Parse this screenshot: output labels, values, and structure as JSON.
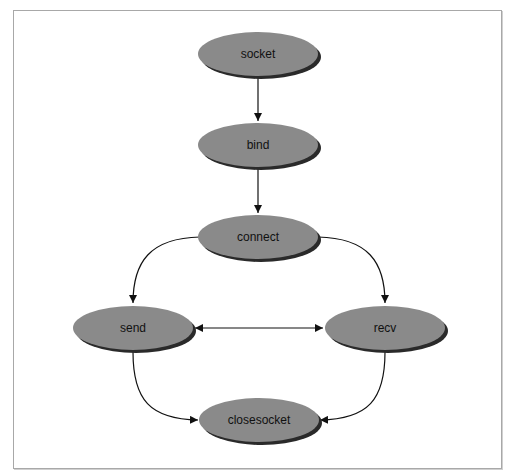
{
  "diagram": {
    "type": "flowchart",
    "colors": {
      "node_fill": "#8a8a8a",
      "node_shadow": "#2a2a2a",
      "edge": "#111111",
      "frame": "#a8a8a8"
    },
    "nodes": [
      {
        "id": "socket",
        "label": "socket"
      },
      {
        "id": "bind",
        "label": "bind"
      },
      {
        "id": "connect",
        "label": "connect"
      },
      {
        "id": "send",
        "label": "send"
      },
      {
        "id": "recv",
        "label": "recv"
      },
      {
        "id": "closesocket",
        "label": "closesocket"
      }
    ],
    "edges": [
      {
        "from": "socket",
        "to": "bind",
        "direction": "forward"
      },
      {
        "from": "bind",
        "to": "connect",
        "direction": "forward"
      },
      {
        "from": "connect",
        "to": "send",
        "direction": "forward"
      },
      {
        "from": "connect",
        "to": "recv",
        "direction": "forward"
      },
      {
        "from": "send",
        "to": "recv",
        "direction": "both"
      },
      {
        "from": "send",
        "to": "closesocket",
        "direction": "forward"
      },
      {
        "from": "recv",
        "to": "closesocket",
        "direction": "forward"
      }
    ]
  }
}
